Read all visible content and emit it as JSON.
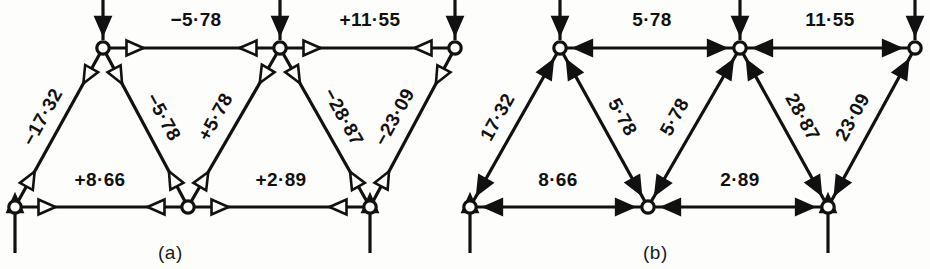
{
  "figure": {
    "background": "#fdfdfb",
    "ink": "#111111",
    "panels": [
      {
        "id": "a",
        "caption": "(a)",
        "caption_x": 180,
        "caption_y": 242,
        "arrowhead_style": "hollow",
        "sign_convention": "signed",
        "members": [
          {
            "name": "top-left-chord",
            "label": "−5·78",
            "x1": 103,
            "y1": 48,
            "x2": 280,
            "y2": 48,
            "lx": 196,
            "ly": 26,
            "rot": 0,
            "double_arrow": true
          },
          {
            "name": "top-right-chord",
            "label": "+11·55",
            "x1": 280,
            "y1": 48,
            "x2": 455,
            "y2": 48,
            "lx": 370,
            "ly": 26,
            "rot": 0,
            "double_arrow": true
          },
          {
            "name": "bottom-left-chord",
            "label": "+8·66",
            "x1": 15,
            "y1": 207,
            "x2": 188,
            "y2": 207,
            "lx": 100,
            "ly": 186,
            "rot": 0,
            "double_arrow": true
          },
          {
            "name": "bottom-right-chord",
            "label": "+2·89",
            "x1": 188,
            "y1": 207,
            "x2": 370,
            "y2": 207,
            "lx": 281,
            "ly": 186,
            "rot": 0,
            "double_arrow": true
          },
          {
            "name": "diagonal-1",
            "label": "−17·32",
            "x1": 15,
            "y1": 207,
            "x2": 103,
            "y2": 48,
            "lx": 48,
            "ly": 120,
            "rot": -61,
            "double_arrow": true
          },
          {
            "name": "diagonal-2",
            "label": "−5·78",
            "x1": 103,
            "y1": 48,
            "x2": 188,
            "y2": 207,
            "lx": 158,
            "ly": 120,
            "rot": 61,
            "double_arrow": true
          },
          {
            "name": "diagonal-3",
            "label": "+5·78",
            "x1": 188,
            "y1": 207,
            "x2": 280,
            "y2": 48,
            "lx": 221,
            "ly": 120,
            "rot": -61,
            "double_arrow": true
          },
          {
            "name": "diagonal-4",
            "label": "−28·87",
            "x1": 280,
            "y1": 48,
            "x2": 370,
            "y2": 207,
            "lx": 338,
            "ly": 120,
            "rot": 61,
            "double_arrow": true
          },
          {
            "name": "diagonal-5",
            "label": "−23·09",
            "x1": 370,
            "y1": 207,
            "x2": 455,
            "y2": 48,
            "lx": 400,
            "ly": 120,
            "rot": -61,
            "double_arrow": true
          }
        ],
        "nodes": [
          {
            "name": "node-bottom-left",
            "x": 15,
            "y": 207
          },
          {
            "name": "node-bottom-mid",
            "x": 188,
            "y": 207
          },
          {
            "name": "node-bottom-right",
            "x": 370,
            "y": 207
          },
          {
            "name": "node-top-left",
            "x": 103,
            "y": 48
          },
          {
            "name": "node-top-mid",
            "x": 280,
            "y": 48
          },
          {
            "name": "node-top-right",
            "x": 455,
            "y": 48
          }
        ],
        "external_forces": [
          {
            "name": "load-top-left",
            "x": 103,
            "y": 48,
            "dir": "down"
          },
          {
            "name": "load-top-mid",
            "x": 280,
            "y": 48,
            "dir": "down"
          },
          {
            "name": "load-top-right",
            "x": 455,
            "y": 48,
            "dir": "down"
          },
          {
            "name": "reaction-bottom-left",
            "x": 15,
            "y": 207,
            "dir": "up"
          },
          {
            "name": "reaction-bottom-right",
            "x": 370,
            "y": 207,
            "dir": "up"
          }
        ]
      },
      {
        "id": "b",
        "caption": "(b)",
        "caption_x": 665,
        "caption_y": 242,
        "arrowhead_style": "solid",
        "sign_convention": "magnitude",
        "members": [
          {
            "name": "top-left-chord",
            "label": "5·78",
            "x1": 560,
            "y1": 48,
            "x2": 740,
            "y2": 48,
            "lx": 652,
            "ly": 26,
            "rot": 0,
            "double_arrow": true
          },
          {
            "name": "top-right-chord",
            "label": "11·55",
            "x1": 740,
            "y1": 48,
            "x2": 915,
            "y2": 48,
            "lx": 830,
            "ly": 26,
            "rot": 0,
            "double_arrow": true
          },
          {
            "name": "bottom-left-chord",
            "label": "8·66",
            "x1": 470,
            "y1": 207,
            "x2": 648,
            "y2": 207,
            "lx": 558,
            "ly": 186,
            "rot": 0,
            "double_arrow": true
          },
          {
            "name": "bottom-right-chord",
            "label": "2·89",
            "x1": 648,
            "y1": 207,
            "x2": 828,
            "y2": 207,
            "lx": 740,
            "ly": 186,
            "rot": 0,
            "double_arrow": true
          },
          {
            "name": "diagonal-1",
            "label": "17·32",
            "x1": 470,
            "y1": 207,
            "x2": 560,
            "y2": 48,
            "lx": 503,
            "ly": 120,
            "rot": -61,
            "double_arrow": true
          },
          {
            "name": "diagonal-2",
            "label": "5·78",
            "x1": 560,
            "y1": 48,
            "x2": 648,
            "y2": 207,
            "lx": 617,
            "ly": 120,
            "rot": 61,
            "double_arrow": true
          },
          {
            "name": "diagonal-3",
            "label": "5·78",
            "x1": 648,
            "y1": 207,
            "x2": 740,
            "y2": 48,
            "lx": 680,
            "ly": 120,
            "rot": -61,
            "double_arrow": true
          },
          {
            "name": "diagonal-4",
            "label": "28·87",
            "x1": 740,
            "y1": 48,
            "x2": 828,
            "y2": 207,
            "lx": 797,
            "ly": 120,
            "rot": 61,
            "double_arrow": true
          },
          {
            "name": "diagonal-5",
            "label": "23·09",
            "x1": 828,
            "y1": 207,
            "x2": 915,
            "y2": 48,
            "lx": 858,
            "ly": 120,
            "rot": -61,
            "double_arrow": true
          }
        ],
        "nodes": [
          {
            "name": "node-bottom-left",
            "x": 470,
            "y": 207
          },
          {
            "name": "node-bottom-mid",
            "x": 648,
            "y": 207
          },
          {
            "name": "node-bottom-right",
            "x": 828,
            "y": 207
          },
          {
            "name": "node-top-left",
            "x": 560,
            "y": 48
          },
          {
            "name": "node-top-mid",
            "x": 740,
            "y": 48
          },
          {
            "name": "node-top-right",
            "x": 915,
            "y": 48
          }
        ],
        "external_forces": [
          {
            "name": "load-top-left",
            "x": 560,
            "y": 48,
            "dir": "down"
          },
          {
            "name": "load-top-mid",
            "x": 740,
            "y": 48,
            "dir": "down"
          },
          {
            "name": "load-top-right",
            "x": 915,
            "y": 48,
            "dir": "down"
          },
          {
            "name": "reaction-bottom-left",
            "x": 470,
            "y": 207,
            "dir": "up"
          },
          {
            "name": "reaction-bottom-right",
            "x": 828,
            "y": 207,
            "dir": "up"
          }
        ]
      }
    ]
  }
}
